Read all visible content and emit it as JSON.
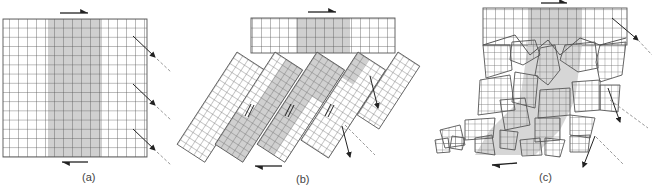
{
  "figure": {
    "panels": [
      {
        "id": "a",
        "label": "(a)",
        "description": "Intact square grid under shear; shaded central band"
      },
      {
        "id": "b",
        "label": "(b)",
        "description": "Grid broken into rotated blocks (bookshelf faulting) beneath intact upper layer"
      },
      {
        "id": "c",
        "label": "(c)",
        "description": "Upper layer over chaotic fragmented blocks (breccia)"
      }
    ],
    "colors": {
      "grid_line": "#555555",
      "shaded_band": "#d0d0d0",
      "arrow": "#222222",
      "dashed": "#999999",
      "background": "#ffffff"
    },
    "grid": {
      "columns": 16,
      "rows_a": 15,
      "shaded_columns": [
        5,
        10
      ],
      "top_layer_rows": 4
    }
  }
}
